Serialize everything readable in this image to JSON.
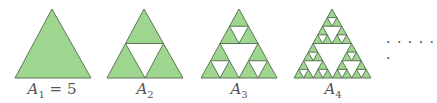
{
  "figure": {
    "fill_color": "#9fd68f",
    "stroke_color": "#4f6a48",
    "hole_color": "#ffffff",
    "items": [
      {
        "label_var": "A",
        "label_sub": "1",
        "label_rest": " = 5",
        "level": 0,
        "apex": [
          52,
          9
        ],
        "left": [
          15,
          78
        ],
        "right": [
          91,
          78
        ],
        "label_x": 52
      },
      {
        "label_var": "A",
        "label_sub": "2",
        "label_rest": "",
        "level": 1,
        "apex": [
          144,
          9
        ],
        "left": [
          107,
          78
        ],
        "right": [
          183,
          78
        ],
        "label_x": 145
      },
      {
        "label_var": "A",
        "label_sub": "3",
        "label_rest": "",
        "level": 2,
        "apex": [
          239,
          9
        ],
        "left": [
          201,
          78
        ],
        "right": [
          277,
          78
        ],
        "label_x": 239
      },
      {
        "label_var": "A",
        "label_sub": "4",
        "label_rest": "",
        "level": 3,
        "apex": [
          332,
          9
        ],
        "left": [
          294,
          78
        ],
        "right": [
          371,
          78
        ],
        "label_x": 333
      }
    ],
    "continuation": "· · · · · ·"
  }
}
